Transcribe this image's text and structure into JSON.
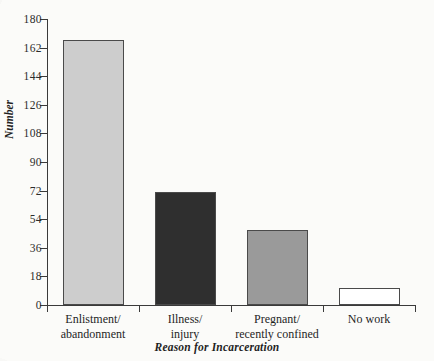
{
  "chart_data": {
    "type": "bar",
    "title": "",
    "subtitle": "",
    "xlabel": "Reason for Incarceration",
    "ylabel": "Number",
    "categories": [
      "Enlistment/ abandonment",
      "Illness/ injury",
      "Pregnant/ recently confined",
      "No work"
    ],
    "category_lines": [
      [
        "Enlistment/",
        "abandonment"
      ],
      [
        "Illness/",
        "injury"
      ],
      [
        "Pregnant/",
        "recently confined"
      ],
      [
        "No work"
      ]
    ],
    "values": [
      167,
      71,
      47,
      11
    ],
    "bar_colors": [
      "#cdcdcd",
      "#2f2f2f",
      "#9a9a9a",
      "#ffffff"
    ],
    "ylim": [
      0,
      180
    ],
    "yticks": [
      0,
      18,
      36,
      54,
      72,
      90,
      108,
      126,
      144,
      162,
      180
    ],
    "ytick_labels": [
      "0",
      "18",
      "36",
      "54",
      "72",
      "90",
      "108",
      "126",
      "144",
      "162",
      "180"
    ],
    "grid": false,
    "legend": null,
    "legend_position": "none",
    "annotations": []
  },
  "style": {
    "axis_color": "#3a3a3a",
    "bar_edge_color": "#4a4a4a",
    "text_color": "#1f1f1f",
    "background": "#fbfbfa"
  }
}
